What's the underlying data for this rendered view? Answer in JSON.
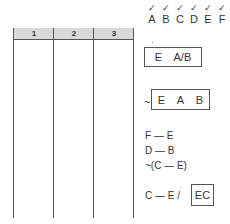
{
  "table": {
    "columns": [
      "1",
      "2",
      "3"
    ],
    "rows": []
  },
  "checklist": {
    "mark": "✓",
    "letters": [
      "A",
      "B",
      "C",
      "D",
      "E",
      "F"
    ]
  },
  "boxes": {
    "box1": {
      "parts": [
        "E",
        "A/B"
      ]
    },
    "box2": {
      "prefix": "~",
      "parts": [
        "E",
        "A",
        "B"
      ]
    },
    "box3": {
      "label": "EC"
    }
  },
  "rules": [
    "F — E",
    "D — B",
    "~(C — E)"
  ],
  "final_rule": "C — E /"
}
